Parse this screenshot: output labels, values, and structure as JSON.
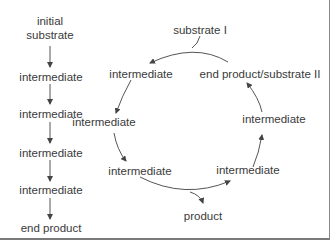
{
  "linear_pathway": {
    "steps": [
      {
        "label": "initial\nsubstrate",
        "line1": "initial",
        "line2": "substrate"
      },
      {
        "label": "intermediate"
      },
      {
        "label": "intermediate"
      },
      {
        "label": "intermediate"
      },
      {
        "label": "intermediate"
      },
      {
        "label": "end product"
      }
    ]
  },
  "cyclic_pathway": {
    "input": "substrate I",
    "nodes": [
      {
        "label": "end product/substrate II"
      },
      {
        "label": "intermediate"
      },
      {
        "label": "intermediate"
      },
      {
        "label": "intermediate"
      },
      {
        "label": "intermediate"
      },
      {
        "label": "intermediate"
      }
    ],
    "output": "product"
  },
  "colors": {
    "text": "#3a3a3a",
    "arrow": "#444444",
    "border": "#8a8a8a"
  }
}
